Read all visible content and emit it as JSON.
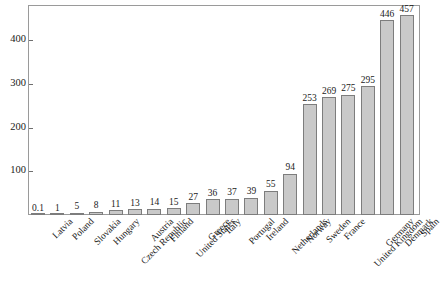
{
  "chart_data": {
    "type": "bar",
    "title": "",
    "subtitle": "",
    "xlabel": "",
    "ylabel": "",
    "categories": [
      "Latvia",
      "Poland",
      "Slovakia",
      "Hungary",
      "Czech Republic",
      "Austria",
      "Finland",
      "United States",
      "Greece",
      "Italy",
      "Portugal",
      "Ireland",
      "Netherlands",
      "Norway",
      "Sweden",
      "France",
      "United Kingdom",
      "Germany",
      "Denmark",
      "Spain"
    ],
    "values": [
      0.1,
      1,
      5,
      8,
      11,
      13,
      14,
      15,
      27,
      36,
      37,
      39,
      55,
      94,
      253,
      269,
      275,
      295,
      446,
      457
    ],
    "value_labels": [
      "0.1",
      "1",
      "5",
      "8",
      "11",
      "13",
      "14",
      "15",
      "27",
      "36",
      "37",
      "39",
      "55",
      "94",
      "253",
      "269",
      "275",
      "295",
      "446",
      "457"
    ],
    "ylim": [
      0,
      478
    ],
    "yticks": [
      100,
      200,
      300,
      400
    ],
    "ytick_labels": [
      "100",
      "200",
      "300",
      "400"
    ],
    "grid": false,
    "legend": "none",
    "bar_color": "#c9c9c9",
    "bar_edge_color": "#7d7d7d",
    "axis_color": "#9a9a9a",
    "text_color": "#1a1a1a",
    "background": "#ffffff"
  }
}
